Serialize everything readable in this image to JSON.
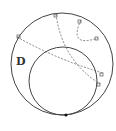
{
  "diagram": {
    "type": "hyperbolic-disk",
    "region_label": "D",
    "colors": {
      "stroke": "#444444",
      "dashed": "#666666",
      "point": "#111111",
      "background": "#ffffff"
    },
    "outer_circle": {
      "cx": 62,
      "cy": 64,
      "r": 51
    },
    "horocycle": {
      "cx": 63,
      "cy": 81,
      "r": 34
    },
    "tangent_point": {
      "x": 66,
      "y": 115
    },
    "geodesics": [
      {
        "name": "geodesic-top-to-right-lower",
        "d": "M56,14 Q62,60 100,84"
      },
      {
        "name": "geodesic-top-right-arc",
        "d": "M81,20 Q68,48 98,38"
      },
      {
        "name": "geodesic-left-to-right",
        "d": "M17,37 Q58,60 103,73"
      }
    ],
    "right_angle_markers": [
      {
        "x": 56,
        "y": 14
      },
      {
        "x": 81,
        "y": 20
      },
      {
        "x": 98,
        "y": 38
      },
      {
        "x": 17,
        "y": 37
      },
      {
        "x": 103,
        "y": 73
      },
      {
        "x": 100,
        "y": 84
      }
    ]
  }
}
